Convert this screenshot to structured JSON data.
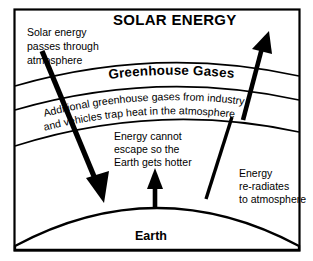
{
  "diagram": {
    "title": "SOLAR ENERGY",
    "labels": {
      "solar_in_line1": "Solar energy",
      "solar_in_line2": "passes through",
      "solar_in_line3": "atmosphere",
      "greenhouse_layer": "Greenhouse Gases",
      "additional_line1": "Additional greenhouse gases from industry",
      "additional_line2": "and vehicles trap heat in the atmosphere",
      "trapped_line1": "Energy cannot",
      "trapped_line2": "escape so the",
      "trapped_line3": "Earth gets hotter",
      "reradiate_line1": "Energy",
      "reradiate_line2": "re-radiates",
      "reradiate_line3": "to atmosphere",
      "earth": "Earth"
    },
    "colors": {
      "ink": "#000000",
      "background": "#ffffff"
    }
  }
}
